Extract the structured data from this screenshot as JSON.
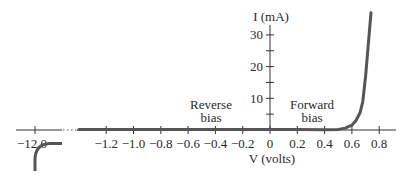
{
  "chart_data": {
    "type": "line",
    "title": "",
    "xlabel": "V (volts)",
    "ylabel": "I (mA)",
    "xlim": [
      -1.4,
      0.92
    ],
    "ylim": [
      0,
      37
    ],
    "grid": false,
    "legend": null,
    "x_ticks": [
      -1.2,
      -1.0,
      -0.8,
      -0.6,
      -0.4,
      -0.2,
      0,
      0.2,
      0.4,
      0.6,
      0.8
    ],
    "x_tick_labels": [
      "−1.2",
      "−1.0",
      "−0.8",
      "−0.6",
      "−0.4",
      "−0.2",
      "0",
      "0.2",
      "0.4",
      "0.6",
      "0.8"
    ],
    "y_ticks": [
      5,
      10,
      15,
      20,
      25,
      30
    ],
    "y_tick_labels": {
      "10": "10",
      "20": "20",
      "30": "30"
    },
    "axis_break": {
      "break_from": -1.4,
      "break_label_value": -12.0,
      "break_label": "−12.0",
      "description": "Horizontal axis broken between −12.0 V and −1.4 V"
    },
    "annotations": [
      {
        "text_lines": [
          "Reverse",
          "bias"
        ],
        "x": -0.4,
        "y": 8
      },
      {
        "text_lines": [
          "Forward",
          "bias"
        ],
        "x": 0.35,
        "y": 8
      }
    ],
    "series": [
      {
        "name": "Diode I–V characteristic (forward + reverse)",
        "color": "#555555",
        "points": [
          [
            -1.4,
            0.0
          ],
          [
            -1.2,
            0.0
          ],
          [
            -1.0,
            0.0
          ],
          [
            -0.8,
            0.0
          ],
          [
            -0.6,
            0.0
          ],
          [
            -0.4,
            0.0
          ],
          [
            -0.2,
            0.0
          ],
          [
            0.0,
            0.0
          ],
          [
            0.2,
            0.0
          ],
          [
            0.4,
            0.05
          ],
          [
            0.5,
            0.2
          ],
          [
            0.55,
            0.6
          ],
          [
            0.6,
            1.5
          ],
          [
            0.63,
            3.0
          ],
          [
            0.66,
            5.5
          ],
          [
            0.68,
            9.0
          ],
          [
            0.7,
            17.0
          ],
          [
            0.72,
            27.0
          ],
          [
            0.74,
            37.0
          ]
        ]
      },
      {
        "name": "Reverse breakdown near −12.0 V",
        "color": "#555555",
        "description": "Current drops sharply (large negative) at breakdown voltage −12.0 V",
        "points_px_note": "Drawn as a curve bending down below the axis at −12.0"
      }
    ]
  },
  "labels": {
    "y_axis_title": "I (mA)",
    "x_axis_title": "V (volts)",
    "reverse_line1": "Reverse",
    "reverse_line2": "bias",
    "forward_line1": "Forward",
    "forward_line2": "bias",
    "break_tick": "−12.0"
  },
  "colors": {
    "curve": "#555555",
    "axis": "#333333",
    "text": "#2a2a2a"
  }
}
